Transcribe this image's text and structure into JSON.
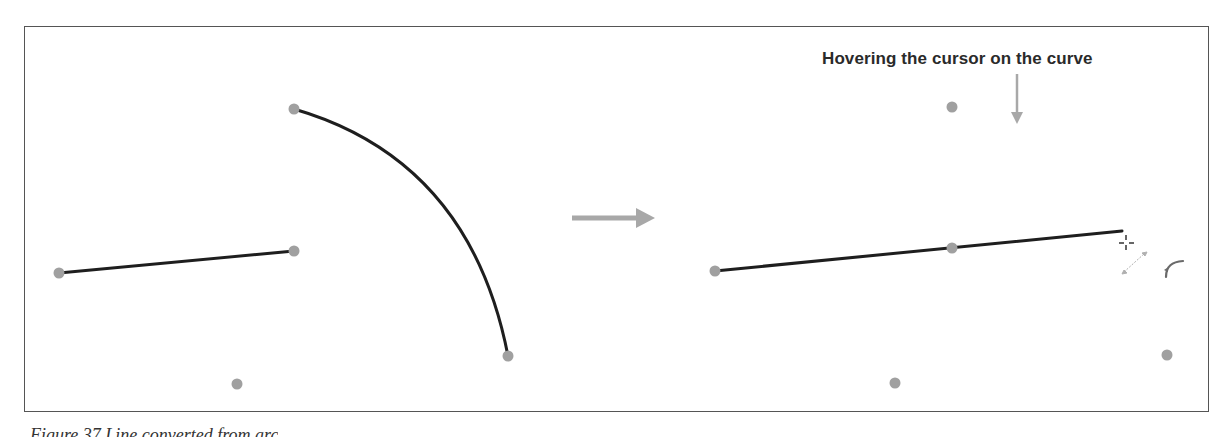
{
  "annotation": {
    "text": "Hovering the cursor on the curve"
  },
  "caption": {
    "text": "Figure 37 Line converted from arc"
  },
  "colors": {
    "curve": "#1e1e1e",
    "point": "#a0a0a0",
    "arrow": "#a8a8a8",
    "frame": "#555555",
    "text": "#2a2a2a"
  },
  "icons": {
    "transition_arrow": "right-arrow-icon",
    "pointer_arrow": "down-arrow-icon",
    "cursor": "crosshair-cursor-icon",
    "resize_handle": "diagonal-resize-icon",
    "curve_tool": "curve-tool-icon"
  },
  "before": {
    "line": {
      "x1": 59,
      "y1": 273,
      "x2": 294,
      "y2": 251
    },
    "arc": {
      "start": [
        294,
        109
      ],
      "end": [
        508,
        356
      ]
    },
    "points": [
      {
        "x": 59,
        "y": 273
      },
      {
        "x": 294,
        "y": 251
      },
      {
        "x": 294,
        "y": 109
      },
      {
        "x": 508,
        "y": 356
      },
      {
        "x": 237,
        "y": 384
      }
    ]
  },
  "after": {
    "line": {
      "x1": 715,
      "y1": 271,
      "x2": 1122,
      "y2": 231
    },
    "points": [
      {
        "x": 715,
        "y": 271
      },
      {
        "x": 952,
        "y": 248
      },
      {
        "x": 952,
        "y": 107
      },
      {
        "x": 895,
        "y": 383
      },
      {
        "x": 1167,
        "y": 355
      }
    ]
  }
}
